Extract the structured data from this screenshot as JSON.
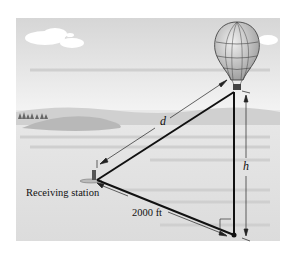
{
  "figure": {
    "labels": {
      "station": "Receiving station",
      "distance_ground": "2000 ft",
      "hypotenuse": "d",
      "height": "h"
    },
    "colors": {
      "sky_top": "#d9d9d9",
      "sky_bottom": "#f2f2f2",
      "ground": "#e4e4e4",
      "hill": "#bdbdbd",
      "line": "#111111"
    }
  }
}
